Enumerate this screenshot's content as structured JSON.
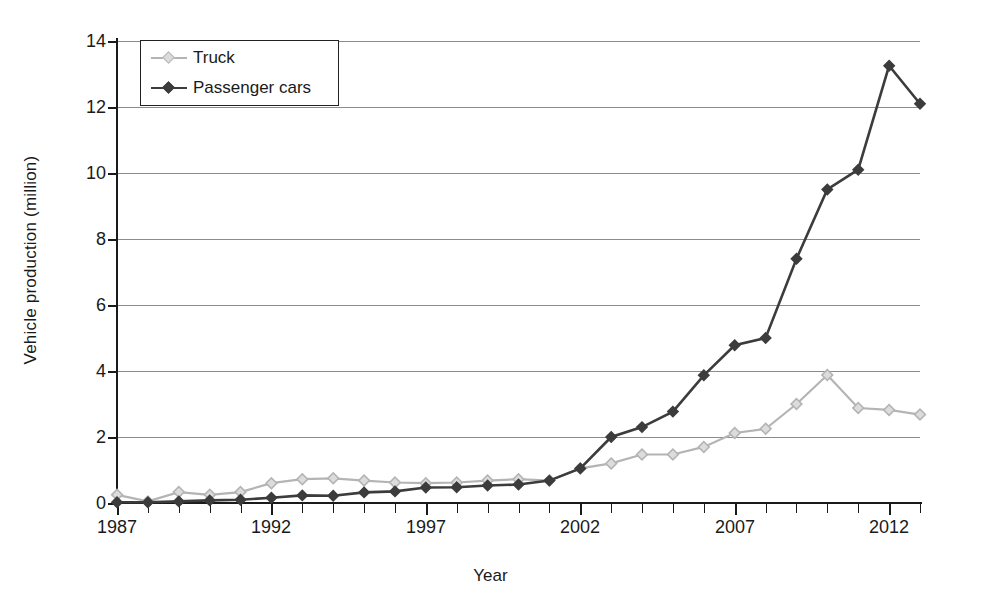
{
  "chart_data": {
    "type": "line",
    "title": "",
    "xlabel": "Year",
    "ylabel": "Vehicle production (million)",
    "xlim": [
      1987,
      2013
    ],
    "ylim": [
      0,
      14
    ],
    "ytick_values": [
      0,
      2,
      4,
      6,
      8,
      10,
      12,
      14
    ],
    "ytick_labels": [
      "0",
      "2",
      "4",
      "6",
      "8",
      "10",
      "12",
      "14"
    ],
    "xtick_values": [
      1987,
      1992,
      1997,
      2002,
      2007,
      2012
    ],
    "xtick_labels": [
      "1987",
      "1992",
      "1997",
      "2002",
      "2007",
      "2012"
    ],
    "x": [
      1987,
      1988,
      1989,
      1990,
      1991,
      1992,
      1993,
      1994,
      1995,
      1996,
      1997,
      1998,
      1999,
      2000,
      2001,
      2002,
      2003,
      2004,
      2005,
      2006,
      2007,
      2008,
      2009,
      2010,
      2011,
      2012,
      2013
    ],
    "grid": "horizontal",
    "legend_position": "top-left",
    "series": [
      {
        "name": "Truck",
        "color": "#b4b4b4",
        "marker": "diamond",
        "values": [
          0.25,
          0.05,
          0.33,
          0.25,
          0.33,
          0.6,
          0.72,
          0.75,
          0.68,
          0.62,
          0.6,
          0.62,
          0.68,
          0.72,
          0.68,
          1.05,
          1.2,
          1.47,
          1.47,
          1.7,
          2.12,
          2.25,
          3.0,
          3.88,
          2.88,
          2.82,
          2.68
        ]
      },
      {
        "name": "Passenger cars",
        "color": "#3c3c3c",
        "marker": "diamond",
        "values": [
          0.02,
          0.02,
          0.05,
          0.08,
          0.1,
          0.16,
          0.23,
          0.22,
          0.32,
          0.35,
          0.47,
          0.48,
          0.53,
          0.56,
          0.68,
          1.05,
          2.0,
          2.3,
          2.77,
          3.87,
          4.78,
          5.0,
          7.4,
          9.5,
          10.1,
          13.25,
          12.1
        ]
      }
    ]
  },
  "axes": {
    "y_axis_title": "Vehicle production (million)",
    "x_axis_title": "Year"
  },
  "legend": {
    "items": [
      {
        "label": "Truck",
        "color": "#b4b4b4"
      },
      {
        "label": "Passenger cars",
        "color": "#3c3c3c"
      }
    ]
  }
}
